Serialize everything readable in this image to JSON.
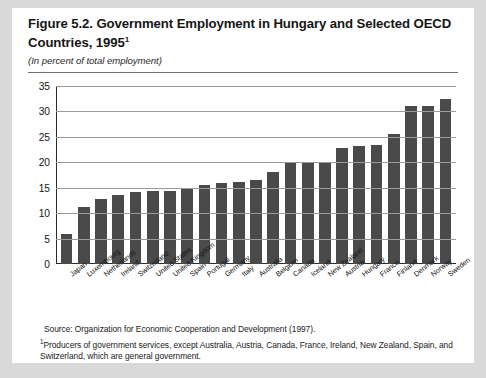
{
  "figure": {
    "title_line1": "Figure 5.2. Government Employment in Hungary and Selected OECD",
    "title_line2": "Countries, 1995",
    "title_footnote_marker": "1",
    "subtitle": "(In percent of total employment)",
    "source_note": "Source:  Organization for Economic Cooperation and Development (1997).",
    "footnote_marker": "1",
    "footnote_text": "Producers of government services, except Australia, Austria, Canada, France, Ireland, New Zealand, Spain, and Switzerland, which are general government."
  },
  "colors": {
    "bar": "#4a4a4a",
    "page_background": "#d9d9d9",
    "figure_background": "#ffffff",
    "gridline": "#9a9a9a",
    "axis": "#2b2b2b"
  },
  "chart_data": {
    "type": "bar",
    "title": "Figure 5.2. Government Employment in Hungary and Selected OECD Countries, 1995",
    "subtitle": "(In percent of total employment)",
    "xlabel": "",
    "ylabel": "",
    "ylim": [
      0,
      35
    ],
    "yticks": [
      0,
      5,
      10,
      15,
      20,
      25,
      30,
      35
    ],
    "grid": true,
    "legend": "none",
    "categories": [
      "Japan",
      "Luxembourg",
      "Netherlands",
      "Ireland",
      "Switzerland",
      "United States",
      "United Kingdom",
      "Spain",
      "Portugal",
      "Germany",
      "Italy",
      "Australia",
      "Belgium",
      "Canada",
      "Iceland",
      "New Zealand",
      "Austria",
      "Hungary",
      "France",
      "Finland",
      "Denmark",
      "Norway",
      "Sweden"
    ],
    "values": [
      6.0,
      11.2,
      12.8,
      13.5,
      14.2,
      14.4,
      14.4,
      15.0,
      15.5,
      16.0,
      16.2,
      16.5,
      18.0,
      19.8,
      20.0,
      20.1,
      22.8,
      23.2,
      23.5,
      25.5,
      31.0,
      31.0,
      32.5
    ]
  }
}
